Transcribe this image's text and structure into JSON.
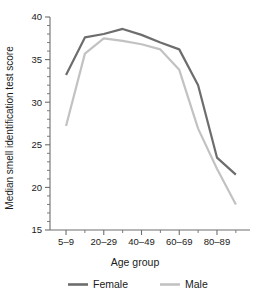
{
  "chart_data": {
    "type": "line",
    "title": "",
    "xlabel": "Age group",
    "ylabel": "Median smell identification test score",
    "categories": [
      "5–9",
      "10–19",
      "20–29",
      "30–39",
      "40–49",
      "50–59",
      "60–69",
      "70–79",
      "80–89",
      "90–99"
    ],
    "xtick_labels": [
      "5–9",
      "20–29",
      "40–49",
      "60–69",
      "80–89"
    ],
    "ytick_labels": [
      "15",
      "20",
      "25",
      "30",
      "35",
      "40"
    ],
    "ylim": [
      15,
      40
    ],
    "ytick_step": 5,
    "yminor_step": 1,
    "grid": false,
    "legend_position": "bottom",
    "series": [
      {
        "name": "Female",
        "color": "#6d6d6d",
        "values": [
          33.2,
          37.6,
          38.0,
          38.6,
          37.9,
          37.0,
          36.2,
          32.0,
          23.5,
          21.5
        ]
      },
      {
        "name": "Male",
        "color": "#c2c2c2",
        "values": [
          27.2,
          35.7,
          37.5,
          37.2,
          36.8,
          36.2,
          33.8,
          26.9,
          22.2,
          18.0
        ]
      }
    ]
  },
  "legend": {
    "items": [
      {
        "label": "Female",
        "color": "#6d6d6d"
      },
      {
        "label": "Male",
        "color": "#c2c2c2"
      }
    ]
  },
  "axis": {
    "x_title": "Age group",
    "y_title": "Median smell identification test score"
  }
}
